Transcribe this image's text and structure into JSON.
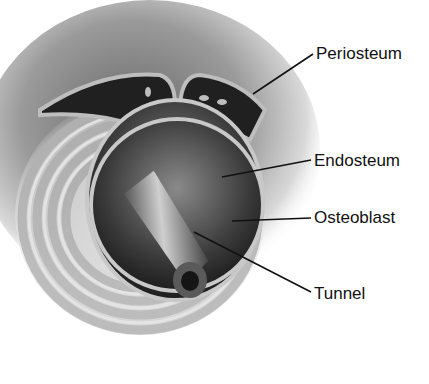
{
  "figure": {
    "style": "grayscale",
    "labels": [
      {
        "id": "periosteum",
        "text": "Periosteum",
        "x": 316,
        "y": 44,
        "line": [
          313,
          54,
          253,
          94
        ]
      },
      {
        "id": "endosteum",
        "text": "Endosteum",
        "x": 314,
        "y": 152,
        "line": [
          311,
          160,
          222,
          177
        ]
      },
      {
        "id": "osteoblast",
        "text": "Osteoblast",
        "x": 314,
        "y": 208,
        "line": [
          311,
          218,
          232,
          221
        ]
      },
      {
        "id": "tunnel",
        "text": "Tunnel",
        "x": 314,
        "y": 285,
        "line": [
          311,
          292,
          194,
          232
        ]
      }
    ]
  },
  "colors": {
    "background": "#ffffff",
    "leader_line": "#111111",
    "canal_dark": "#2a2a2a",
    "bone_light": "#d8d8d8"
  }
}
